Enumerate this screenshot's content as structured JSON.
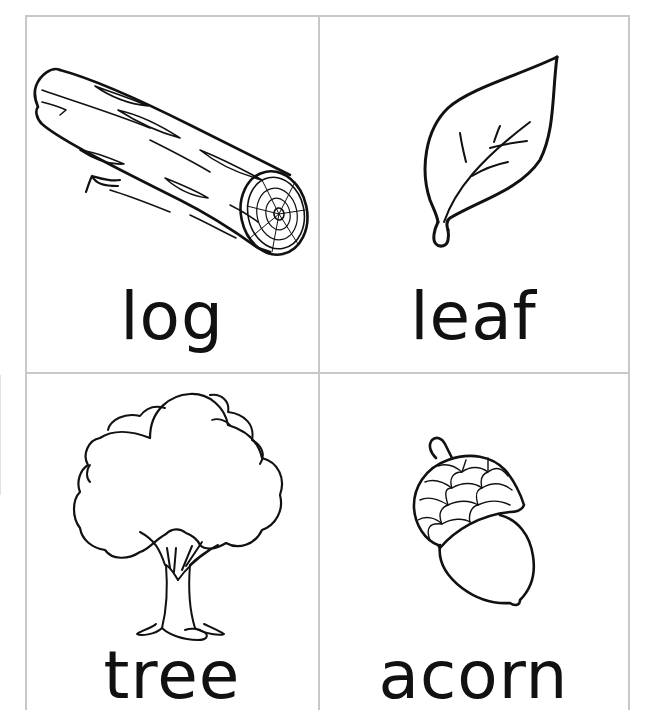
{
  "sheet": {
    "title": "Nature vocabulary flashcards",
    "border_color": "#c8c8c8",
    "line_color": "#111111",
    "cards": [
      {
        "word": "log",
        "icon": "log-icon",
        "position": "top-left"
      },
      {
        "word": "leaf",
        "icon": "leaf-icon",
        "position": "top-right"
      },
      {
        "word": "tree",
        "icon": "tree-icon",
        "position": "bottom-left"
      },
      {
        "word": "acorn",
        "icon": "acorn-icon",
        "position": "bottom-right"
      }
    ]
  }
}
